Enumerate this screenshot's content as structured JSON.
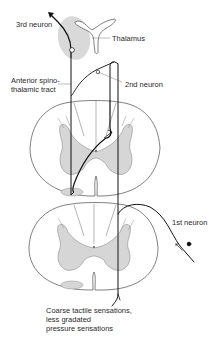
{
  "diagram": {
    "labels": {
      "third_neuron": "3rd neuron",
      "thalamus": "Thalamus",
      "anterior_tract_line1": "Anterior spino-",
      "anterior_tract_line2": "thalamic tract",
      "second_neuron": "2nd neuron",
      "first_neuron": "1st neuron",
      "sensation_line1": "Coarse tactile sensations,",
      "sensation_line2": "less gradated",
      "sensation_line3": "pressure sensations"
    },
    "caption": "",
    "colors": {
      "outline": "#4a4a4a",
      "gray_matter": "#d6d6d6",
      "thalamus_region": "#d9d9d9",
      "neuron_path": "#111111",
      "text": "#2a2a2a"
    },
    "structures": [
      {
        "name": "thalamus",
        "type": "brain-region"
      },
      {
        "name": "upper-spinal-cord-section",
        "type": "cross-section"
      },
      {
        "name": "lower-spinal-cord-section",
        "type": "cross-section"
      }
    ],
    "neurons": [
      {
        "name": "1st neuron",
        "from": "periphery",
        "to": "dorsal horn (lower section), ascending"
      },
      {
        "name": "2nd neuron",
        "from": "dorsal horn (upper section)",
        "to": "thalamus via anterior spinothalamic tract (crosses midline)"
      },
      {
        "name": "3rd neuron",
        "from": "thalamus",
        "to": "cortex"
      }
    ]
  }
}
